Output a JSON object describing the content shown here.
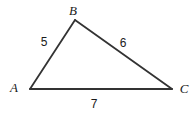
{
  "figure": {
    "type": "triangle-diagram",
    "background_color": "#ffffff",
    "stroke_color": "#333333",
    "text_color": "#1a1a1a",
    "width": 195,
    "height": 116,
    "vertices": [
      {
        "name": "A",
        "label": "A",
        "x": 30,
        "y": 89,
        "label_x": 14,
        "label_y": 87
      },
      {
        "name": "B",
        "label": "B",
        "x": 75,
        "y": 20,
        "label_x": 73,
        "label_y": 10
      },
      {
        "name": "C",
        "label": "C",
        "x": 172,
        "y": 89,
        "label_x": 184,
        "label_y": 88
      }
    ],
    "sides": [
      {
        "name": "AB",
        "from": "A",
        "to": "B",
        "label": "5",
        "label_x": 44,
        "label_y": 42
      },
      {
        "name": "BC",
        "from": "B",
        "to": "C",
        "label": "6",
        "label_x": 123,
        "label_y": 43
      },
      {
        "name": "CA",
        "from": "C",
        "to": "A",
        "label": "7",
        "label_x": 94,
        "label_y": 104
      }
    ]
  }
}
